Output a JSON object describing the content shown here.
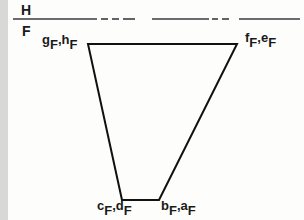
{
  "diagram": {
    "planes": {
      "upper": "H",
      "lower": "F"
    },
    "vertices": {
      "top_left": {
        "main": "g",
        "sub1": "F",
        "sep": ",",
        "main2": "h",
        "sub2": "F"
      },
      "top_right": {
        "main": "f",
        "sub1": "F",
        "sep": ",",
        "main2": "e",
        "sub2": "F"
      },
      "bottom_left": {
        "main": "c",
        "sub1": "F",
        "sep": ",",
        "main2": "d",
        "sub2": "F"
      },
      "bottom_right": {
        "main": "b",
        "sub1": "F",
        "sep": ",",
        "main2": "a",
        "sub2": "F"
      }
    },
    "shape": {
      "type": "trapezoid",
      "points": [
        [
          88,
          44
        ],
        [
          237,
          44
        ],
        [
          159,
          200
        ],
        [
          122,
          200
        ]
      ]
    },
    "fold_line": {
      "y": 19,
      "segments": [
        [
          13,
          97,
          "solid"
        ],
        [
          101,
          108,
          "dash"
        ],
        [
          112,
          119,
          "dash"
        ],
        [
          123,
          135,
          "dash"
        ],
        [
          152,
          209,
          "solid"
        ],
        [
          212,
          218,
          "dash"
        ],
        [
          222,
          229,
          "dash"
        ],
        [
          239,
          300,
          "solid"
        ]
      ]
    }
  }
}
